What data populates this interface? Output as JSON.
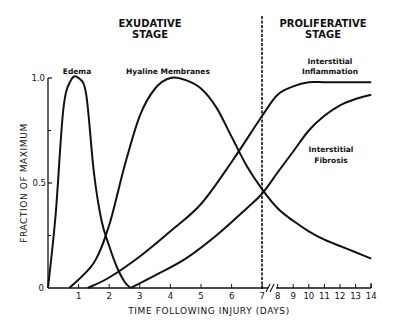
{
  "chart_data": {
    "type": "line",
    "title": "",
    "xlabel": "TIME FOLLOWING INJURY (DAYS)",
    "ylabel": "FRACTION OF MAXIMUM",
    "ylim": [
      0,
      1.0
    ],
    "xlim": [
      0,
      14
    ],
    "x_axis_break": "between 7 and 8 (compressed scale after day 7)",
    "grid": false,
    "legend": "inline labels",
    "x_ticks": [
      "1",
      "2",
      "3",
      "4",
      "5",
      "6",
      "7",
      "8",
      "9",
      "10",
      "11",
      "12",
      "13",
      "14"
    ],
    "y_ticks": [
      "0",
      "0.5",
      "1.0"
    ],
    "annotations": [
      {
        "text": "EXUDATIVE STAGE",
        "region": "days 0-7"
      },
      {
        "text": "PROLIFERATIVE STAGE",
        "region": "days 7-14"
      },
      {
        "text": "dashed vertical line",
        "x": 7
      }
    ],
    "series": [
      {
        "name": "Edema",
        "x": [
          0,
          0.25,
          0.5,
          0.75,
          1.0,
          1.25,
          1.5,
          1.75,
          2.0,
          2.25,
          2.5,
          2.7
        ],
        "values": [
          0,
          0.35,
          0.85,
          0.99,
          1.0,
          0.92,
          0.55,
          0.32,
          0.2,
          0.1,
          0.03,
          0
        ]
      },
      {
        "name": "Hyaline Membranes",
        "x": [
          0.7,
          1.5,
          2.0,
          2.5,
          3.0,
          3.5,
          4.0,
          4.5,
          5.0,
          5.5,
          6.0,
          6.5,
          7.0,
          8.0,
          9.0,
          10.0,
          11.0,
          12.0,
          13.0,
          14.0
        ],
        "values": [
          0,
          0.12,
          0.3,
          0.58,
          0.82,
          0.95,
          1.0,
          0.99,
          0.95,
          0.86,
          0.72,
          0.58,
          0.47,
          0.38,
          0.32,
          0.27,
          0.23,
          0.2,
          0.17,
          0.14
        ]
      },
      {
        "name": "Interstitial Inflammation",
        "x": [
          1.3,
          2.0,
          3.0,
          4.0,
          5.0,
          6.0,
          7.0,
          8.0,
          9.0,
          10.0,
          11.0,
          12.0,
          13.0,
          14.0
        ],
        "values": [
          0,
          0.05,
          0.15,
          0.27,
          0.4,
          0.6,
          0.82,
          0.92,
          0.96,
          0.98,
          0.98,
          0.98,
          0.98,
          0.98
        ]
      },
      {
        "name": "Interstitial Fibrosis",
        "x": [
          2.7,
          3.5,
          4.5,
          5.5,
          6.5,
          7.0,
          8.0,
          9.0,
          10.0,
          11.0,
          12.0,
          13.0,
          14.0
        ],
        "values": [
          0,
          0.06,
          0.14,
          0.25,
          0.38,
          0.45,
          0.55,
          0.65,
          0.75,
          0.82,
          0.87,
          0.9,
          0.92
        ]
      }
    ]
  },
  "labels": {
    "exudative_line1": "EXUDATIVE",
    "exudative_line2": "STAGE",
    "proliferative_line1": "PROLIFERATIVE",
    "proliferative_line2": "STAGE",
    "edema": "Edema",
    "hyaline": "Hyaline Membranes",
    "inflammation_line1": "Interstitial",
    "inflammation_line2": "Inflammation",
    "fibrosis_line1": "Interstitial",
    "fibrosis_line2": "Fibrosis",
    "xlabel": "TIME FOLLOWING INJURY (DAYS)",
    "ylabel": "FRACTION OF MAXIMUM",
    "y_tick_0": "0",
    "y_tick_05": "0.5",
    "y_tick_1": "1.0",
    "x_ticks": [
      "1",
      "2",
      "3",
      "4",
      "5",
      "6",
      "7",
      "8",
      "9",
      "10",
      "11",
      "12",
      "13",
      "14"
    ]
  }
}
